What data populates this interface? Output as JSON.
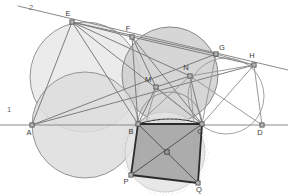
{
  "figure": {
    "title": "",
    "width": 288,
    "height": 196,
    "background": "#ffffff"
  },
  "colors": {
    "circle_light_fill": "#e8e8e8",
    "circle_mid_fill": "#cfcfcf",
    "circle_dark_fill": "#bdbdbd",
    "quad_fill": "#a9a9a9",
    "stroke_main": "#777777",
    "stroke_thin": "#9a9a9a",
    "stroke_heavy": "#2b2b2b",
    "label_color": "#3a3a3a",
    "line_label_color": "#6b6b6b",
    "hatch_color": "#c9c9c9"
  },
  "points": [
    {
      "id": "A",
      "label": "A",
      "x": 32,
      "y": 125,
      "lx": 29,
      "ly": 135
    },
    {
      "id": "B",
      "label": "B",
      "x": 138,
      "y": 124,
      "lx": 131,
      "ly": 134
    },
    {
      "id": "C",
      "label": "C",
      "x": 202,
      "y": 124,
      "lx": 200,
      "ly": 134
    },
    {
      "id": "D",
      "label": "D",
      "x": 262,
      "y": 125,
      "lx": 260,
      "ly": 135
    },
    {
      "id": "E",
      "label": "E",
      "x": 72,
      "y": 22,
      "lx": 68,
      "ly": 16
    },
    {
      "id": "F",
      "label": "F",
      "x": 132,
      "y": 37,
      "lx": 128,
      "ly": 31
    },
    {
      "id": "G",
      "label": "G",
      "x": 216,
      "y": 54,
      "lx": 222,
      "ly": 50
    },
    {
      "id": "H",
      "label": "H",
      "x": 254,
      "y": 65,
      "lx": 252,
      "ly": 58
    },
    {
      "id": "M",
      "label": "M",
      "x": 156,
      "y": 87,
      "lx": 148,
      "ly": 82
    },
    {
      "id": "N",
      "label": "N",
      "x": 190,
      "y": 76,
      "lx": 186,
      "ly": 70
    },
    {
      "id": "P",
      "label": "P",
      "x": 131,
      "y": 175,
      "lx": 126,
      "ly": 184
    },
    {
      "id": "Q",
      "label": "Q",
      "x": 198,
      "y": 183,
      "lx": 199,
      "ly": 192
    }
  ],
  "line_labels": [
    {
      "id": "line1",
      "label": "1",
      "x": 9,
      "y": 112
    },
    {
      "id": "line2",
      "label": "2",
      "x": 31,
      "y": 10
    }
  ],
  "circles": [
    {
      "id": "circle-left",
      "cx": 85,
      "cy": 77,
      "r": 55,
      "fill": "#e8e8e8",
      "stroke": "#8a8a8a"
    },
    {
      "id": "circle-middle",
      "cx": 170,
      "cy": 75,
      "r": 48,
      "fill": "#cfcfcf",
      "stroke": "#7d7d7d"
    },
    {
      "id": "circle-right",
      "cx": 226,
      "cy": 96,
      "r": 38,
      "fill": "none",
      "stroke": "#9a9a9a"
    },
    {
      "id": "circle-bc",
      "cx": 170,
      "cy": 124,
      "r": 32,
      "fill": "none",
      "stroke": "#8a8a8a"
    },
    {
      "id": "circle-ab",
      "cx": 85,
      "cy": 125,
      "r": 53,
      "fill": "#dddddd",
      "stroke": "#8a8a8a"
    },
    {
      "id": "circle-bottom",
      "cx": 165,
      "cy": 152,
      "r": 40,
      "fill": "#e4e4e4",
      "stroke": "#c9c9c9"
    }
  ],
  "segments": [
    {
      "id": "baseline",
      "from": [
        0,
        125
      ],
      "to": [
        288,
        125
      ],
      "stroke": "#8a8a8a",
      "width": 1
    },
    {
      "id": "ray-2",
      "from": [
        18,
        6
      ],
      "to": [
        288,
        70
      ],
      "stroke": "#8a8a8a",
      "width": 1
    },
    {
      "id": "A-E",
      "from": [
        32,
        125
      ],
      "to": [
        72,
        22
      ],
      "stroke": "#7d7d7d",
      "width": 1
    },
    {
      "id": "E-F",
      "from": [
        72,
        22
      ],
      "to": [
        132,
        37
      ],
      "stroke": "#7d7d7d",
      "width": 1
    },
    {
      "id": "E-C",
      "from": [
        72,
        22
      ],
      "to": [
        202,
        124
      ],
      "stroke": "#7d7d7d",
      "width": 1
    },
    {
      "id": "E-B",
      "from": [
        72,
        22
      ],
      "to": [
        138,
        124
      ],
      "stroke": "#7d7d7d",
      "width": 1
    },
    {
      "id": "E-N",
      "from": [
        72,
        22
      ],
      "to": [
        190,
        76
      ],
      "stroke": "#7d7d7d",
      "width": 1
    },
    {
      "id": "E-G",
      "from": [
        72,
        22
      ],
      "to": [
        216,
        54
      ],
      "stroke": "#7d7d7d",
      "width": 1
    },
    {
      "id": "A-G",
      "from": [
        32,
        125
      ],
      "to": [
        216,
        54
      ],
      "stroke": "#7d7d7d",
      "width": 1
    },
    {
      "id": "A-H",
      "from": [
        32,
        125
      ],
      "to": [
        254,
        65
      ],
      "stroke": "#7d7d7d",
      "width": 1
    },
    {
      "id": "F-B",
      "from": [
        132,
        37
      ],
      "to": [
        138,
        124
      ],
      "stroke": "#7d7d7d",
      "width": 1
    },
    {
      "id": "F-C",
      "from": [
        132,
        37
      ],
      "to": [
        202,
        124
      ],
      "stroke": "#7d7d7d",
      "width": 1
    },
    {
      "id": "F-M",
      "from": [
        132,
        37
      ],
      "to": [
        156,
        87
      ],
      "stroke": "#7d7d7d",
      "width": 1
    },
    {
      "id": "F-H",
      "from": [
        132,
        37
      ],
      "to": [
        254,
        65
      ],
      "stroke": "#7d7d7d",
      "width": 1
    },
    {
      "id": "M-N",
      "from": [
        156,
        87
      ],
      "to": [
        190,
        76
      ],
      "stroke": "#7d7d7d",
      "width": 1
    },
    {
      "id": "M-B",
      "from": [
        156,
        87
      ],
      "to": [
        138,
        124
      ],
      "stroke": "#7d7d7d",
      "width": 1
    },
    {
      "id": "M-C",
      "from": [
        156,
        87
      ],
      "to": [
        202,
        124
      ],
      "stroke": "#9a9a9a",
      "width": 1
    },
    {
      "id": "N-C",
      "from": [
        190,
        76
      ],
      "to": [
        202,
        124
      ],
      "stroke": "#7d7d7d",
      "width": 1
    },
    {
      "id": "N-B",
      "from": [
        190,
        76
      ],
      "to": [
        138,
        124
      ],
      "stroke": "#9a9a9a",
      "width": 1
    },
    {
      "id": "N-H",
      "from": [
        190,
        76
      ],
      "to": [
        254,
        65
      ],
      "stroke": "#9a9a9a",
      "width": 1
    },
    {
      "id": "N-D",
      "from": [
        190,
        76
      ],
      "to": [
        262,
        125
      ],
      "stroke": "#9a9a9a",
      "width": 1
    },
    {
      "id": "G-H",
      "from": [
        216,
        54
      ],
      "to": [
        254,
        65
      ],
      "stroke": "#9a9a9a",
      "width": 1
    },
    {
      "id": "G-C",
      "from": [
        216,
        54
      ],
      "to": [
        202,
        124
      ],
      "stroke": "#9a9a9a",
      "width": 1
    },
    {
      "id": "H-C",
      "from": [
        254,
        65
      ],
      "to": [
        202,
        124
      ],
      "stroke": "#9a9a9a",
      "width": 1
    },
    {
      "id": "H-D",
      "from": [
        254,
        65
      ],
      "to": [
        262,
        125
      ],
      "stroke": "#9a9a9a",
      "width": 1
    },
    {
      "id": "M-P",
      "from": [
        156,
        87
      ],
      "to": [
        131,
        175
      ],
      "stroke": "#9a9a9a",
      "width": 1
    },
    {
      "id": "N-Q",
      "from": [
        190,
        76
      ],
      "to": [
        198,
        183
      ],
      "stroke": "#9a9a9a",
      "width": 1
    }
  ],
  "quadrilateral": {
    "id": "quad-BCQP",
    "vertices": [
      "B",
      "C",
      "Q",
      "P"
    ],
    "points": "138,124 202,124 198,183 131,175",
    "fill": "#a9a9a9",
    "stroke": "#2b2b2b",
    "width": 1.8,
    "diagonals": [
      {
        "id": "diag-BQ",
        "from": [
          138,
          124
        ],
        "to": [
          198,
          183
        ]
      },
      {
        "id": "diag-CP",
        "from": [
          202,
          124
        ],
        "to": [
          131,
          175
        ]
      }
    ],
    "center": {
      "x": 167,
      "y": 152
    }
  },
  "arc_BC": {
    "id": "arc-BC-top",
    "path": "M 138 124 Q 170 114 202 124"
  },
  "hatch_mark": {
    "id": "hatch-BC",
    "x1": 140,
    "y1": 120,
    "x2": 200,
    "y2": 120
  }
}
